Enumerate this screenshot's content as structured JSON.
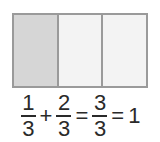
{
  "figure": {
    "bar_model": {
      "total_parts": 3,
      "shaded_parts": 1,
      "cells": [
        {
          "label": "1",
          "state": "filled"
        },
        {
          "label": "2",
          "state": "empty"
        },
        {
          "label": "3",
          "state": "empty"
        }
      ],
      "colors": {
        "border": "#9a9a9a",
        "filled": "#d6d6d6",
        "empty": "#f3f3f3",
        "background": "#ffffff"
      }
    },
    "equation": {
      "full_text": "1/3 + 2/3 = 3/3 = 1",
      "terms": [
        {
          "kind": "fraction",
          "numerator": "1",
          "denominator": "3"
        },
        {
          "kind": "operator",
          "symbol": "+"
        },
        {
          "kind": "fraction",
          "numerator": "2",
          "denominator": "3"
        },
        {
          "kind": "operator",
          "symbol": "="
        },
        {
          "kind": "fraction",
          "numerator": "3",
          "denominator": "3"
        },
        {
          "kind": "operator",
          "symbol": "="
        },
        {
          "kind": "whole",
          "value": "1"
        }
      ],
      "text_color": "#2a2a2a"
    }
  }
}
